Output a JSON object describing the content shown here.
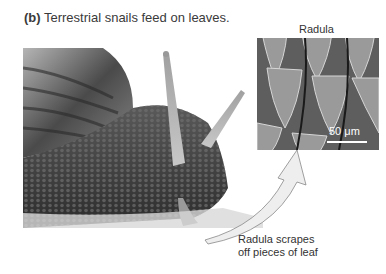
{
  "caption": {
    "label": "(b)",
    "text": " Terrestrial snails feed on leaves."
  },
  "inset": {
    "title": "Radula",
    "scale_bar": "50 μm"
  },
  "callout": {
    "line1": "Radula scrapes",
    "line2": "off pieces of leaf"
  },
  "colors": {
    "text": "#333333",
    "arrow_fill": "#eeeeee",
    "arrow_stroke": "#888888"
  }
}
